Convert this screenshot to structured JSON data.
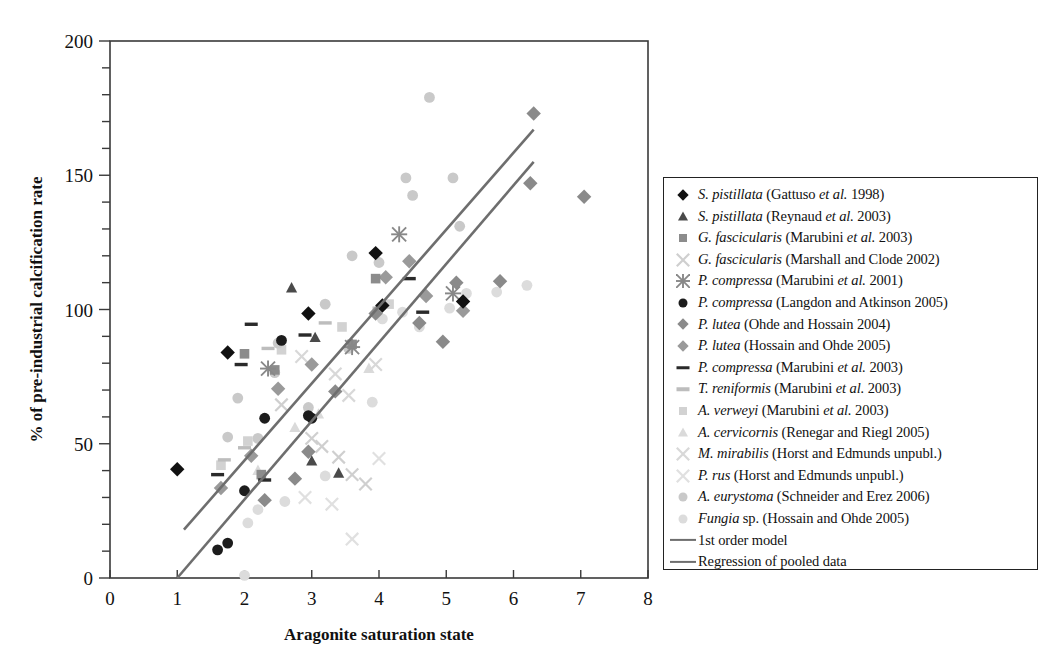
{
  "chart_data": {
    "type": "scatter",
    "title": "",
    "xlabel": "Aragonite saturation state",
    "ylabel": "% of pre-industrial calcification rate",
    "xlim": [
      0,
      8
    ],
    "ylim": [
      0,
      200
    ],
    "xticks": [
      0,
      1,
      2,
      3,
      4,
      5,
      6,
      7,
      8
    ],
    "yticks": [
      0,
      50,
      100,
      150,
      200
    ],
    "y_minor_tick_interval": 10,
    "grid": false,
    "legend_position": "right-outside",
    "series": [
      {
        "name": "S. pistillata (Gattuso et al. 1998)",
        "marker": "diamond",
        "color": "#111111",
        "points": [
          [
            1.0,
            40.5
          ],
          [
            1.75,
            84.0
          ],
          [
            2.95,
            98.5
          ],
          [
            3.95,
            121.0
          ],
          [
            4.05,
            101.5
          ],
          [
            5.25,
            103.0
          ]
        ]
      },
      {
        "name": "S. pistillata (Reynaud et al. 2003)",
        "marker": "triangle",
        "color": "#4a4a4a",
        "points": [
          [
            2.7,
            108.0
          ],
          [
            3.0,
            43.5
          ],
          [
            3.4,
            39.0
          ],
          [
            3.05,
            89.5
          ]
        ]
      },
      {
        "name": "G. fascicularis (Marubini et al. 2003)",
        "marker": "square",
        "color": "#8c8c8c",
        "points": [
          [
            2.0,
            83.5
          ],
          [
            2.25,
            38.5
          ],
          [
            2.45,
            77.5
          ],
          [
            3.6,
            87.0
          ],
          [
            3.95,
            111.5
          ]
        ]
      },
      {
        "name": "G. fascicularis (Marshall and Clode 2002)",
        "marker": "x",
        "color": "#cfcfcf",
        "points": [
          [
            2.55,
            64.5
          ],
          [
            3.0,
            52.0
          ],
          [
            3.15,
            49.0
          ],
          [
            3.4,
            45.0
          ],
          [
            3.6,
            38.5
          ],
          [
            3.8,
            35.0
          ]
        ]
      },
      {
        "name": "P. compressa (Marubini et al. 2001)",
        "marker": "star",
        "color": "#888888",
        "points": [
          [
            2.35,
            78.0
          ],
          [
            3.6,
            86.0
          ],
          [
            4.3,
            128.0
          ],
          [
            5.1,
            106.0
          ]
        ]
      },
      {
        "name": "P. compressa (Langdon and Atkinson 2005)",
        "marker": "circle",
        "color": "#1c1c1c",
        "points": [
          [
            1.6,
            10.5
          ],
          [
            1.75,
            13.0
          ],
          [
            2.0,
            32.5
          ],
          [
            2.3,
            59.5
          ],
          [
            2.55,
            88.5
          ],
          [
            2.95,
            60.5
          ],
          [
            3.0,
            59.5
          ]
        ]
      },
      {
        "name": "P. lutea (Ohde and Hossain 2004)",
        "marker": "diamond",
        "color": "#8a8a8a",
        "points": [
          [
            2.3,
            29.0
          ],
          [
            2.75,
            37.0
          ],
          [
            2.95,
            47.0
          ],
          [
            3.35,
            69.5
          ],
          [
            3.95,
            98.5
          ],
          [
            4.6,
            95.0
          ],
          [
            4.95,
            88.0
          ],
          [
            5.15,
            110.0
          ],
          [
            5.8,
            110.5
          ],
          [
            6.25,
            147.0
          ],
          [
            6.3,
            173.0
          ],
          [
            7.05,
            142.0
          ]
        ]
      },
      {
        "name": "P. lutea (Hossain and Ohde 2005)",
        "marker": "diamond",
        "color": "#9a9a9a",
        "points": [
          [
            1.65,
            33.5
          ],
          [
            2.1,
            45.5
          ],
          [
            2.5,
            70.5
          ],
          [
            3.0,
            79.5
          ],
          [
            4.1,
            112.0
          ],
          [
            4.45,
            118.0
          ],
          [
            4.7,
            105.0
          ],
          [
            5.25,
            99.5
          ]
        ]
      },
      {
        "name": "P. compressa (Marubini et al. 2003)",
        "marker": "dash",
        "color": "#2a2a2a",
        "points": [
          [
            1.6,
            38.5
          ],
          [
            1.95,
            79.5
          ],
          [
            2.1,
            94.5
          ],
          [
            2.3,
            36.5
          ],
          [
            2.9,
            90.5
          ],
          [
            4.45,
            111.5
          ],
          [
            4.65,
            99.0
          ]
        ]
      },
      {
        "name": "T. reniformis (Marubini et al. 2003)",
        "marker": "dash",
        "color": "#bdbdbd",
        "points": [
          [
            1.7,
            44.0
          ],
          [
            2.0,
            48.5
          ],
          [
            2.35,
            85.5
          ],
          [
            3.2,
            95.0
          ],
          [
            4.0,
            100.5
          ]
        ]
      },
      {
        "name": "A. verweyi (Marubini et al. 2003)",
        "marker": "square",
        "color": "#d2d2d2",
        "points": [
          [
            1.65,
            42.0
          ],
          [
            2.05,
            51.0
          ],
          [
            2.55,
            85.0
          ],
          [
            3.45,
            93.5
          ],
          [
            4.15,
            102.0
          ]
        ]
      },
      {
        "name": "A. cervicornis (Renegar and Riegl 2005)",
        "marker": "triangle",
        "color": "#dadada",
        "points": [
          [
            2.2,
            40.0
          ],
          [
            2.75,
            56.0
          ],
          [
            3.1,
            61.0
          ],
          [
            3.85,
            78.0
          ]
        ]
      },
      {
        "name": "M. mirabilis (Horst and Edmunds unpubl.)",
        "marker": "x",
        "color": "#d8d8d8",
        "points": [
          [
            2.85,
            82.5
          ],
          [
            3.35,
            76.0
          ],
          [
            3.55,
            68.0
          ],
          [
            3.95,
            79.5
          ]
        ]
      },
      {
        "name": "P. rus (Horst and Edmunds unpubl.)",
        "marker": "x",
        "color": "#e0e0e0",
        "points": [
          [
            2.9,
            30.0
          ],
          [
            3.3,
            27.5
          ],
          [
            3.6,
            14.5
          ],
          [
            4.0,
            44.5
          ]
        ]
      },
      {
        "name": "A. eurystoma (Schneider and Erez 2006)",
        "marker": "circle",
        "color": "#c9c9c9",
        "points": [
          [
            1.75,
            52.5
          ],
          [
            1.9,
            67.0
          ],
          [
            2.2,
            52.0
          ],
          [
            2.45,
            76.5
          ],
          [
            2.5,
            87.5
          ],
          [
            2.95,
            63.5
          ],
          [
            3.2,
            102.0
          ],
          [
            3.55,
            85.5
          ],
          [
            3.6,
            120.0
          ],
          [
            4.0,
            117.5
          ],
          [
            4.4,
            149.0
          ],
          [
            4.5,
            142.5
          ],
          [
            4.75,
            179.0
          ],
          [
            5.1,
            149.0
          ],
          [
            5.2,
            131.0
          ]
        ]
      },
      {
        "name": "Fungia sp. (Hossain and Ohde 2005)",
        "marker": "circle",
        "color": "#dcdcdc",
        "points": [
          [
            2.0,
            1.0
          ],
          [
            2.05,
            20.5
          ],
          [
            2.2,
            25.5
          ],
          [
            2.6,
            28.5
          ],
          [
            3.2,
            38.0
          ],
          [
            3.9,
            65.5
          ],
          [
            4.05,
            96.5
          ],
          [
            4.35,
            99.0
          ],
          [
            4.6,
            93.5
          ],
          [
            5.05,
            100.5
          ],
          [
            5.3,
            106.0
          ],
          [
            5.75,
            106.5
          ],
          [
            6.2,
            109.0
          ]
        ]
      }
    ],
    "lines": [
      {
        "name": "1st order model",
        "color": "#6e6e6e",
        "x": [
          1.1,
          6.3
        ],
        "y": [
          18,
          167
        ]
      },
      {
        "name": "Regression of pooled data",
        "color": "#6e6e6e",
        "x": [
          1.0,
          6.3
        ],
        "y": [
          0,
          155
        ]
      }
    ]
  },
  "legend": {
    "entries": [
      {
        "marker": "diamond",
        "color": "#111111",
        "italic": "S. pistillata",
        "rest": " (Gattuso ",
        "italic2": "et al.",
        "rest2": " 1998)"
      },
      {
        "marker": "triangle",
        "color": "#4a4a4a",
        "italic": "S. pistillata",
        "rest": " (Reynaud ",
        "italic2": "et al.",
        "rest2": " 2003)"
      },
      {
        "marker": "square",
        "color": "#8c8c8c",
        "italic": "G. fascicularis",
        "rest": " (Marubini ",
        "italic2": "et al.",
        "rest2": " 2003)"
      },
      {
        "marker": "x",
        "color": "#cfcfcf",
        "italic": "G. fascicularis",
        "rest": " (Marshall and Clode 2002)",
        "italic2": "",
        "rest2": ""
      },
      {
        "marker": "star",
        "color": "#888888",
        "italic": "P. compressa",
        "rest": " (Marubini ",
        "italic2": "et al.",
        "rest2": " 2001)"
      },
      {
        "marker": "circle",
        "color": "#1c1c1c",
        "italic": "P. compressa",
        "rest": " (Langdon and Atkinson 2005)",
        "italic2": "",
        "rest2": ""
      },
      {
        "marker": "diamond",
        "color": "#8a8a8a",
        "italic": "P. lutea",
        "rest": " (Ohde and Hossain 2004)",
        "italic2": "",
        "rest2": ""
      },
      {
        "marker": "diamond",
        "color": "#9a9a9a",
        "italic": "P. lutea",
        "rest": " (Hossain and Ohde 2005)",
        "italic2": "",
        "rest2": ""
      },
      {
        "marker": "dash",
        "color": "#2a2a2a",
        "italic": "P. compressa",
        "rest": " (Marubini ",
        "italic2": "et al.",
        "rest2": " 2003)"
      },
      {
        "marker": "dash",
        "color": "#bdbdbd",
        "italic": "T. reniformis",
        "rest": " (Marubini ",
        "italic2": "et al.",
        "rest2": " 2003)"
      },
      {
        "marker": "square",
        "color": "#d2d2d2",
        "italic": "A. verweyi",
        "rest": " (Marubini ",
        "italic2": "et al.",
        "rest2": " 2003)"
      },
      {
        "marker": "triangle",
        "color": "#dadada",
        "italic": "A. cervicornis",
        "rest": " (Renegar and Riegl 2005)",
        "italic2": "",
        "rest2": ""
      },
      {
        "marker": "x",
        "color": "#d8d8d8",
        "italic": "M. mirabilis",
        "rest": " (Horst and Edmunds unpubl.)",
        "italic2": "",
        "rest2": ""
      },
      {
        "marker": "x",
        "color": "#e0e0e0",
        "italic": "P. rus",
        "rest": " (Horst and Edmunds unpubl.)",
        "italic2": "",
        "rest2": ""
      },
      {
        "marker": "circle",
        "color": "#c9c9c9",
        "italic": "A. eurystoma",
        "rest": " (Schneider and Erez 2006)",
        "italic2": "",
        "rest2": ""
      },
      {
        "marker": "circle",
        "color": "#dcdcdc",
        "italic": "Fungia",
        "rest": " sp. (Hossain and Ohde 2005)",
        "italic2": "",
        "rest2": ""
      },
      {
        "marker": "line",
        "color": "#6e6e6e",
        "italic": "",
        "rest": "1st order model",
        "italic2": "",
        "rest2": ""
      },
      {
        "marker": "line",
        "color": "#6e6e6e",
        "italic": "",
        "rest": "Regression of pooled data",
        "italic2": "",
        "rest2": ""
      }
    ]
  }
}
